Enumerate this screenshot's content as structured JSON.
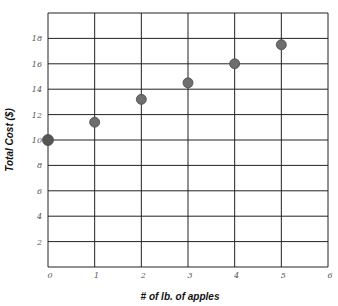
{
  "chart_data": {
    "type": "scatter",
    "title": "",
    "xlabel": "# of lb. of apples",
    "ylabel": "Total Cost ($)",
    "xlim": [
      0,
      6
    ],
    "ylim": [
      0,
      20
    ],
    "grid": true,
    "x_ticks": [
      "0",
      "1",
      "2",
      "3",
      "4",
      "5",
      "6"
    ],
    "y_ticks": [
      "2",
      "4",
      "6",
      "8",
      "10",
      "12",
      "14",
      "16",
      "18"
    ],
    "x": [
      0,
      1,
      2,
      3,
      4,
      5
    ],
    "y": [
      10,
      11.4,
      13.2,
      14.5,
      16,
      17.5
    ],
    "legend": null
  },
  "colors": {
    "grid": "#222222",
    "point": "#6e6e6e",
    "point_first": "#555555",
    "tick_text": "#555555"
  }
}
